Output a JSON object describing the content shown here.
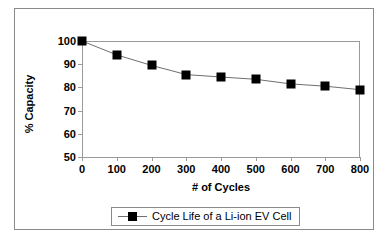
{
  "chart_data": {
    "type": "line",
    "title": "",
    "xlabel": "# of Cycles",
    "ylabel": "% Capacity",
    "x": [
      0,
      100,
      200,
      300,
      400,
      500,
      600,
      700,
      800
    ],
    "xticklabels": [
      "0",
      "100",
      "200",
      "300",
      "400",
      "500",
      "600",
      "700",
      "800"
    ],
    "yticklabels": [
      "50",
      "60",
      "70",
      "80",
      "90",
      "100"
    ],
    "yticks": [
      50,
      60,
      70,
      80,
      90,
      100
    ],
    "xlim": [
      0,
      800
    ],
    "ylim": [
      50,
      100
    ],
    "grid": false,
    "legend_position": "bottom",
    "series": [
      {
        "name": "Cycle Life of a Li-ion EV Cell",
        "values": [
          100,
          94,
          89.5,
          85.5,
          84.5,
          83.5,
          81.5,
          80.5,
          79
        ],
        "color": "#000000",
        "marker": "square",
        "line_color": "#6f6f6f"
      }
    ]
  },
  "legend": {
    "entry_label": "Cycle Life of a Li-ion EV Cell"
  },
  "colors": {
    "frame_border": "#8a8a8a",
    "axis": "#9a9a9a",
    "marker": "#000000",
    "line": "#6f6f6f",
    "background": "#ffffff",
    "text": "#000000"
  }
}
